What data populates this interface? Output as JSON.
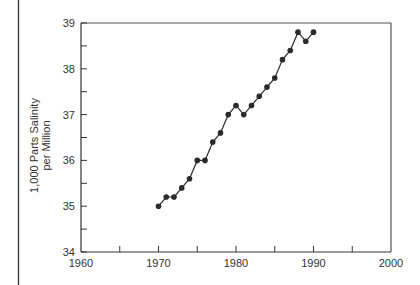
{
  "chart_data": {
    "type": "line",
    "title": "",
    "xlabel": "",
    "ylabel": "1,000 Parts Salinity per Million",
    "ylabel_lines": [
      "1,000 Parts Salinity",
      "per Million"
    ],
    "xlim": [
      1960,
      2000
    ],
    "ylim": [
      34,
      39
    ],
    "x_ticks": [
      1960,
      1970,
      1980,
      1990,
      2000
    ],
    "x_minor_ticks": [
      1965,
      1975,
      1985,
      1995
    ],
    "y_ticks": [
      34,
      35,
      36,
      37,
      38,
      39
    ],
    "y_minor_ticks": [
      34.5,
      35.5,
      36.5,
      37.5,
      38.5
    ],
    "grid": false,
    "legend": null,
    "series": [
      {
        "name": "Salinity",
        "marker": "circle",
        "color": "#2a2a2a",
        "x": [
          1970,
          1971,
          1972,
          1973,
          1974,
          1975,
          1976,
          1977,
          1978,
          1979,
          1980,
          1981,
          1982,
          1983,
          1984,
          1985,
          1986,
          1987,
          1988,
          1989,
          1990
        ],
        "values": [
          35.0,
          35.2,
          35.2,
          35.4,
          35.6,
          36.0,
          36.0,
          36.4,
          36.6,
          37.0,
          37.2,
          37.0,
          37.2,
          37.4,
          37.6,
          37.8,
          38.2,
          38.4,
          38.8,
          38.6,
          38.8
        ]
      }
    ]
  }
}
